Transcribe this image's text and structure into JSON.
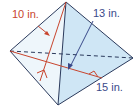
{
  "figure": {
    "type": "triangular-pyramid",
    "labels": {
      "slant_height": "10 in.",
      "height_of_face": "13 in.",
      "base_edge": "15 in."
    },
    "colors": {
      "edge": "#2b3a5c",
      "face_fill": "#cfe6f5",
      "face_fill_light": "#e6f2fa",
      "measure_line": "#c8452e",
      "label_red": "#c8452e",
      "label_blue": "#3a4a8a"
    }
  }
}
